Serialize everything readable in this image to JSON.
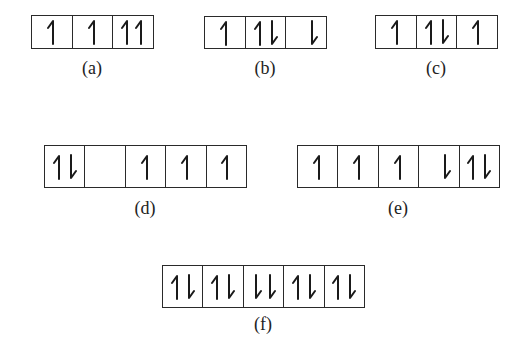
{
  "figure": {
    "diagrams": [
      {
        "id": "a",
        "label": "(a)",
        "orbitals": [
          [
            "up"
          ],
          [
            "up"
          ],
          [
            "up",
            "up"
          ]
        ]
      },
      {
        "id": "b",
        "label": "(b)",
        "orbitals": [
          [
            "up"
          ],
          [
            "up",
            "down"
          ],
          [
            "down"
          ]
        ]
      },
      {
        "id": "c",
        "label": "(c)",
        "orbitals": [
          [
            "up"
          ],
          [
            "up",
            "down"
          ],
          [
            "up"
          ]
        ]
      },
      {
        "id": "d",
        "label": "(d)",
        "orbitals": [
          [
            "up",
            "down"
          ],
          [],
          [
            "up"
          ],
          [
            "up"
          ],
          [
            "up"
          ]
        ]
      },
      {
        "id": "e",
        "label": "(e)",
        "orbitals": [
          [
            "up"
          ],
          [
            "up"
          ],
          [
            "up"
          ],
          [
            "down"
          ],
          [
            "up",
            "down"
          ]
        ]
      },
      {
        "id": "f",
        "label": "(f)",
        "orbitals": [
          [
            "up",
            "down"
          ],
          [
            "up",
            "down"
          ],
          [
            "down",
            "down"
          ],
          [
            "up",
            "down"
          ],
          [
            "up",
            "down"
          ]
        ]
      }
    ],
    "colors": {
      "line": "#2a2a2a",
      "background": "#ffffff"
    }
  }
}
